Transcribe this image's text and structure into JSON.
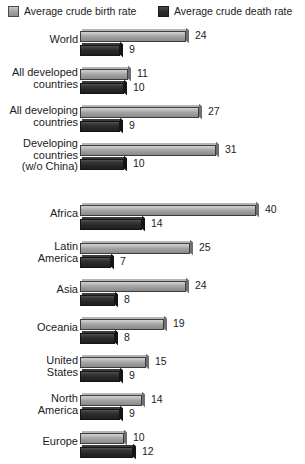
{
  "legend": {
    "birth": {
      "label": "Average crude birth rate",
      "swatch": "light-gray-swatch",
      "color": "#a3a3a3"
    },
    "death": {
      "label": "Average crude death rate",
      "swatch": "dark-gray-swatch",
      "color": "#2b2b2b"
    }
  },
  "chart_data": {
    "type": "bar",
    "orientation": "horizontal",
    "title": "",
    "xlabel": "",
    "ylabel": "",
    "xlim": [
      0,
      40
    ],
    "grid": false,
    "legend_position": "top",
    "categories": [
      "World",
      "All developed countries",
      "All developing countries",
      "Developing countries (w/o China)",
      "Africa",
      "Latin America",
      "Asia",
      "Oceania",
      "United States",
      "North America",
      "Europe"
    ],
    "series": [
      {
        "name": "Average crude birth rate",
        "values": [
          24,
          11,
          27,
          31,
          40,
          25,
          24,
          19,
          15,
          14,
          10
        ]
      },
      {
        "name": "Average crude death rate",
        "values": [
          9,
          10,
          9,
          10,
          14,
          7,
          8,
          8,
          9,
          9,
          12
        ]
      }
    ]
  },
  "groups": [
    {
      "name": "aggregate-group",
      "rows": [
        {
          "label_lines": [
            "World"
          ],
          "birth": 24,
          "death": 9
        },
        {
          "label_lines": [
            "All developed",
            "countries"
          ],
          "birth": 11,
          "death": 10
        },
        {
          "label_lines": [
            "All developing",
            "countries"
          ],
          "birth": 27,
          "death": 9
        },
        {
          "label_lines": [
            "Developing",
            "countries",
            "(w/o China)"
          ],
          "birth": 31,
          "death": 10
        }
      ]
    },
    {
      "name": "region-group",
      "rows": [
        {
          "label_lines": [
            "Africa"
          ],
          "birth": 40,
          "death": 14
        },
        {
          "label_lines": [
            "Latin",
            "America"
          ],
          "birth": 25,
          "death": 7
        },
        {
          "label_lines": [
            "Asia"
          ],
          "birth": 24,
          "death": 8
        },
        {
          "label_lines": [
            "Oceania"
          ],
          "birth": 19,
          "death": 8
        },
        {
          "label_lines": [
            "United",
            "States"
          ],
          "birth": 15,
          "death": 9
        },
        {
          "label_lines": [
            "North",
            "America"
          ],
          "birth": 14,
          "death": 9
        },
        {
          "label_lines": [
            "Europe"
          ],
          "birth": 10,
          "death": 12
        }
      ]
    }
  ]
}
